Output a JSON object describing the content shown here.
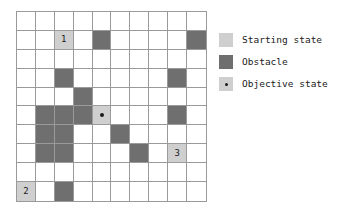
{
  "figure": {
    "type": "grid-world-diagram",
    "grid": {
      "rows": 10,
      "cols": 10,
      "cell_background": "#ffffff",
      "line_color": "#9a9a9a",
      "obstacle_color": "#6f6f6f",
      "start_color": "#cfcfcf",
      "objective_color": "#cfcfcf",
      "dot_color": "#1a1a1a",
      "cells": [
        {
          "row": 1,
          "col": 2,
          "kind": "start",
          "label": "1"
        },
        {
          "row": 1,
          "col": 4,
          "kind": "obstacle",
          "label": ""
        },
        {
          "row": 1,
          "col": 9,
          "kind": "obstacle",
          "label": ""
        },
        {
          "row": 3,
          "col": 2,
          "kind": "obstacle",
          "label": ""
        },
        {
          "row": 3,
          "col": 8,
          "kind": "obstacle",
          "label": ""
        },
        {
          "row": 4,
          "col": 3,
          "kind": "obstacle",
          "label": ""
        },
        {
          "row": 5,
          "col": 1,
          "kind": "obstacle",
          "label": ""
        },
        {
          "row": 5,
          "col": 2,
          "kind": "obstacle",
          "label": ""
        },
        {
          "row": 5,
          "col": 3,
          "kind": "obstacle",
          "label": ""
        },
        {
          "row": 5,
          "col": 4,
          "kind": "objective",
          "label": ""
        },
        {
          "row": 5,
          "col": 8,
          "kind": "obstacle",
          "label": ""
        },
        {
          "row": 6,
          "col": 1,
          "kind": "obstacle",
          "label": ""
        },
        {
          "row": 6,
          "col": 2,
          "kind": "obstacle",
          "label": ""
        },
        {
          "row": 6,
          "col": 5,
          "kind": "obstacle",
          "label": ""
        },
        {
          "row": 7,
          "col": 1,
          "kind": "obstacle",
          "label": ""
        },
        {
          "row": 7,
          "col": 2,
          "kind": "obstacle",
          "label": ""
        },
        {
          "row": 7,
          "col": 6,
          "kind": "obstacle",
          "label": ""
        },
        {
          "row": 7,
          "col": 8,
          "kind": "start",
          "label": "3"
        },
        {
          "row": 9,
          "col": 0,
          "kind": "start",
          "label": "2"
        },
        {
          "row": 9,
          "col": 2,
          "kind": "obstacle",
          "label": ""
        }
      ]
    },
    "legend": {
      "items": [
        {
          "swatch": "start",
          "label": "Starting state"
        },
        {
          "swatch": "obstacle",
          "label": "Obstacle"
        },
        {
          "swatch": "objective",
          "label": "Objective state"
        }
      ]
    }
  }
}
